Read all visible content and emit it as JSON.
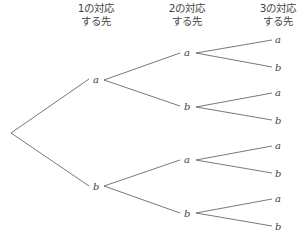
{
  "headers": [
    {
      "line1": "1の対応",
      "line2": "する先"
    },
    {
      "line1": "2の対応",
      "line2": "する先"
    },
    {
      "line1": "3の対応",
      "line2": "する先"
    }
  ],
  "tree": {
    "root": "",
    "level1": [
      "a",
      "b"
    ],
    "level2": [
      "a",
      "b",
      "a",
      "b"
    ],
    "level3": [
      "a",
      "b",
      "a",
      "b",
      "a",
      "b",
      "a",
      "b"
    ]
  }
}
